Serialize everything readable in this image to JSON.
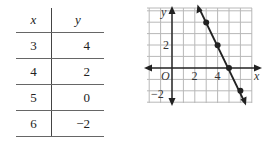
{
  "table": {
    "headers": {
      "x": "x",
      "y": "y"
    },
    "rows": [
      {
        "x": "3",
        "y": "4"
      },
      {
        "x": "4",
        "y": "2"
      },
      {
        "x": "5",
        "y": "0"
      },
      {
        "x": "6",
        "y": "−2"
      }
    ]
  },
  "graph": {
    "x_axis_label": "x",
    "y_axis_label": "y",
    "origin_label": "O",
    "x_tick_labels": [
      "2",
      "4"
    ],
    "y_tick_labels": [
      "2",
      "−2"
    ],
    "points": [
      {
        "x": 3,
        "y": 4
      },
      {
        "x": 4,
        "y": 2
      },
      {
        "x": 5,
        "y": 0
      },
      {
        "x": 6,
        "y": -2
      }
    ],
    "line_color": "#222222",
    "grid_color": "#b0b0b0"
  }
}
